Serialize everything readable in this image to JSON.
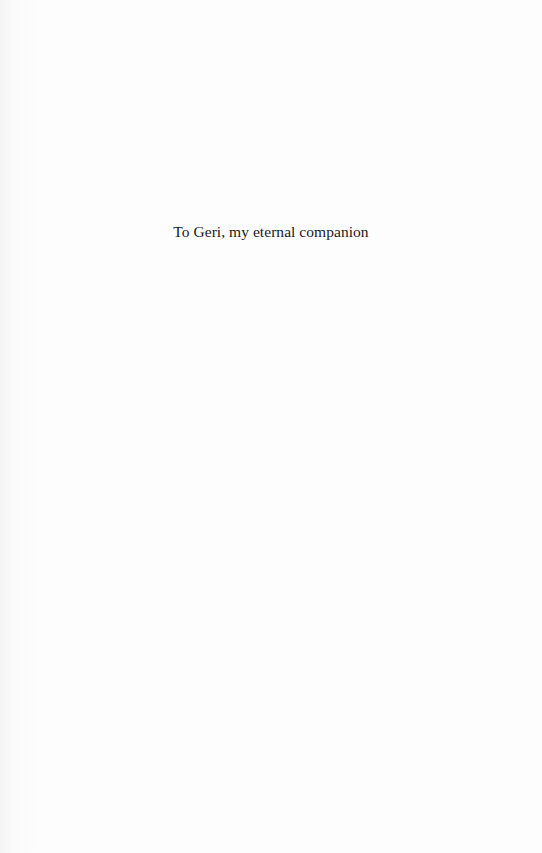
{
  "page": {
    "type": "dedication",
    "dedication_text": "To Geri, my eternal companion"
  }
}
